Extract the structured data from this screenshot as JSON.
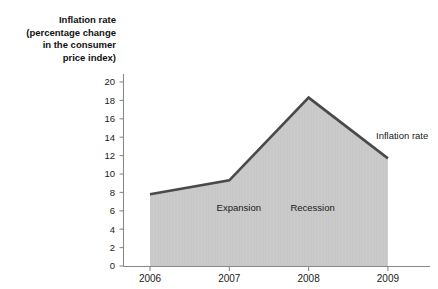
{
  "chart_data": {
    "type": "area",
    "title": "",
    "ylabel": "Inflation rate (percentage change in the consumer price index)",
    "ylabel_lines": [
      "Inflation rate",
      "(percentage change",
      "in the consumer",
      "price index)"
    ],
    "xlabel": "",
    "categories": [
      "2006",
      "2007",
      "2008",
      "2009"
    ],
    "x": [
      2006,
      2007,
      2008,
      2009
    ],
    "values": [
      7.8,
      9.3,
      18.3,
      11.7
    ],
    "series": [
      {
        "name": "Inflation rate",
        "values": [
          7.8,
          9.3,
          18.3,
          11.7
        ]
      }
    ],
    "ylim": [
      0,
      20
    ],
    "yticks": [
      0,
      2,
      4,
      6,
      8,
      10,
      12,
      14,
      16,
      18,
      20
    ],
    "ytick_labels": [
      "0",
      "2",
      "4",
      "6",
      "8",
      "10",
      "12",
      "14",
      "16",
      "18",
      "20"
    ],
    "xtick_labels": [
      "2006",
      "2007",
      "2008",
      "2009"
    ],
    "grid": false,
    "legend_position": "right-inline",
    "series_label": "Inflation rate",
    "annotations": [
      {
        "text": "Expansion",
        "x": 2007.12,
        "y": 6.4
      },
      {
        "text": "Recession",
        "x": 2008.05,
        "y": 6.4
      }
    ],
    "colors": {
      "fill": "#c8c8c8",
      "line": "#4a4a4a",
      "axis": "#8a8a8a",
      "text": "#1a1a1a",
      "background": "#ffffff"
    }
  }
}
